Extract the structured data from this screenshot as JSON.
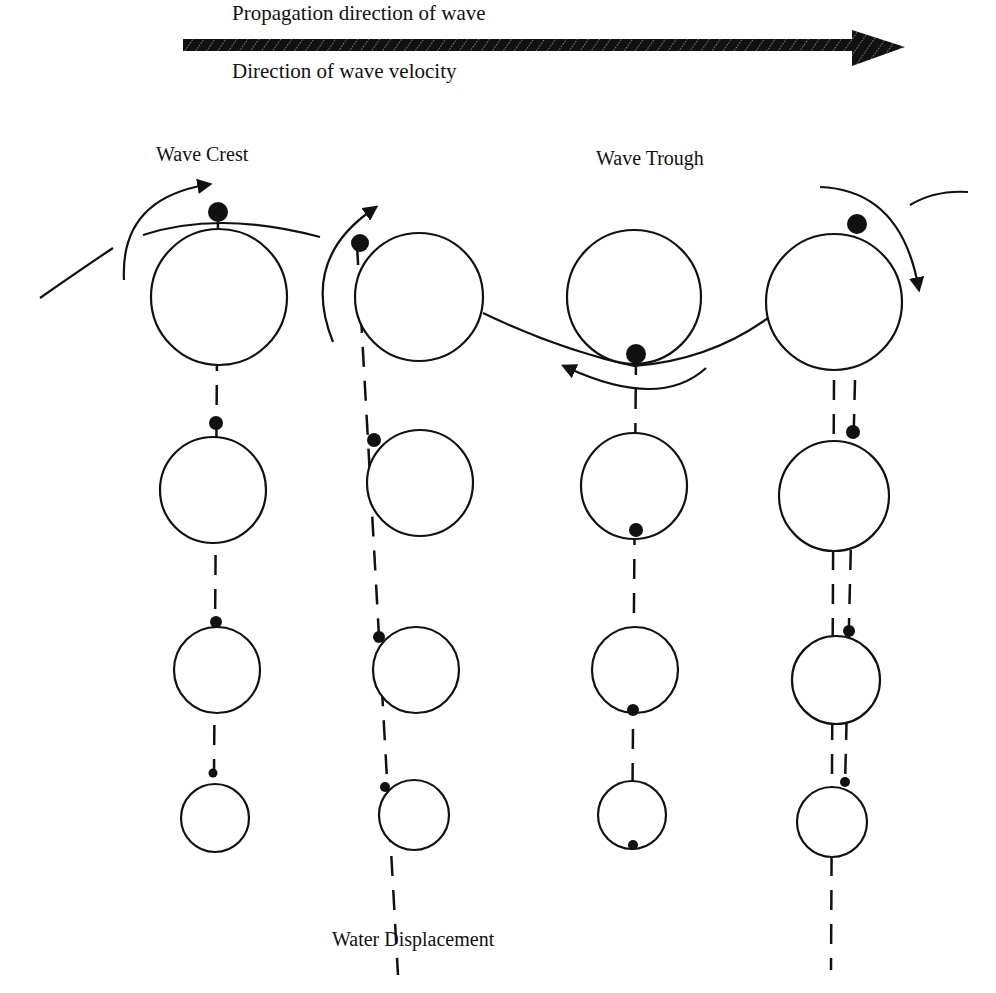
{
  "labels": {
    "propagation": "Propagation direction of wave",
    "velocity": "Direction of wave velocity",
    "crest": "Wave Crest",
    "trough": "Wave Trough",
    "displacement": "Water Displacement"
  },
  "colors": {
    "ink": "#111111",
    "background": "#ffffff"
  },
  "columns": [
    {
      "name": "crest",
      "circles": [
        {
          "cx": 219,
          "cy": 297,
          "r": 68
        },
        {
          "cx": 213,
          "cy": 490,
          "r": 53
        },
        {
          "cx": 217,
          "cy": 670,
          "r": 43
        },
        {
          "cx": 215,
          "cy": 818,
          "r": 34
        }
      ]
    },
    {
      "name": "descending",
      "circles": [
        {
          "cx": 419,
          "cy": 297,
          "r": 64
        },
        {
          "cx": 420,
          "cy": 483,
          "r": 53
        },
        {
          "cx": 416,
          "cy": 670,
          "r": 43
        },
        {
          "cx": 414,
          "cy": 815,
          "r": 35
        }
      ]
    },
    {
      "name": "trough",
      "circles": [
        {
          "cx": 634,
          "cy": 297,
          "r": 67
        },
        {
          "cx": 634,
          "cy": 486,
          "r": 53
        },
        {
          "cx": 635,
          "cy": 670,
          "r": 43
        },
        {
          "cx": 632,
          "cy": 815,
          "r": 34
        }
      ]
    },
    {
      "name": "ascending",
      "circles": [
        {
          "cx": 834,
          "cy": 302,
          "r": 68
        },
        {
          "cx": 834,
          "cy": 496,
          "r": 55
        },
        {
          "cx": 836,
          "cy": 680,
          "r": 44
        },
        {
          "cx": 832,
          "cy": 822,
          "r": 35
        }
      ]
    }
  ]
}
